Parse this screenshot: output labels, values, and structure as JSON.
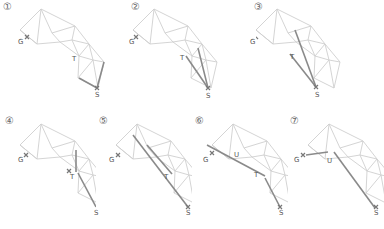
{
  "figure": {
    "panels": [
      {
        "step": "①",
        "labels": {
          "G": "G",
          "T": "T",
          "S": "S"
        }
      },
      {
        "step": "②",
        "labels": {
          "G": "G",
          "T": "T",
          "S": "S"
        }
      },
      {
        "step": "③",
        "labels": {
          "G": "G",
          "T": "T",
          "S": "S"
        }
      },
      {
        "step": "④",
        "labels": {
          "G": "G",
          "T": "T",
          "S": "S"
        }
      },
      {
        "step": "⑤",
        "labels": {
          "G": "G",
          "T": "T",
          "S": "S"
        }
      },
      {
        "step": "⑥",
        "labels": {
          "G": "G",
          "U": "U",
          "T": "T",
          "S": "S"
        }
      },
      {
        "step": "⑦",
        "labels": {
          "G": "G",
          "U": "U",
          "S": "S"
        }
      }
    ],
    "caption": ""
  },
  "colors": {
    "mesh": "#c8c8c8",
    "path": "#8a8a8a",
    "text": "#555555"
  }
}
